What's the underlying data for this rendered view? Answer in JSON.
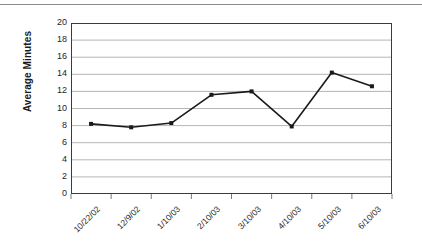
{
  "chart_data": {
    "type": "line",
    "title": "",
    "xlabel": "",
    "ylabel": "Average Minutes",
    "categories": [
      "10/22/02",
      "12/9/02",
      "1/10/03",
      "2/10/03",
      "3/10/03",
      "4/10/03",
      "5/10/03",
      "6/10/03"
    ],
    "values": [
      8.2,
      7.8,
      8.3,
      11.6,
      12.0,
      7.9,
      14.2,
      12.6
    ],
    "series": [
      {
        "name": "Average Minutes",
        "values": [
          8.2,
          7.8,
          8.3,
          11.6,
          12.0,
          7.9,
          14.2,
          12.6
        ]
      }
    ],
    "ylim": [
      0,
      20
    ],
    "ytick_step": 2,
    "yticks": [
      0,
      2,
      4,
      6,
      8,
      10,
      12,
      14,
      16,
      18,
      20
    ],
    "grid": true,
    "grid_axis": "y",
    "legend": false,
    "legend_position": "none",
    "marker": "square",
    "line_color": "#1a1a1a",
    "marker_color": "#1a1a1a",
    "grid_color": "#b5b5b5",
    "axis_color": "#3b3b3b",
    "background_color": "#ffffff",
    "xtick_label_rotation": -45
  },
  "figure": {
    "top_rule_color": "#8a8a8a"
  }
}
